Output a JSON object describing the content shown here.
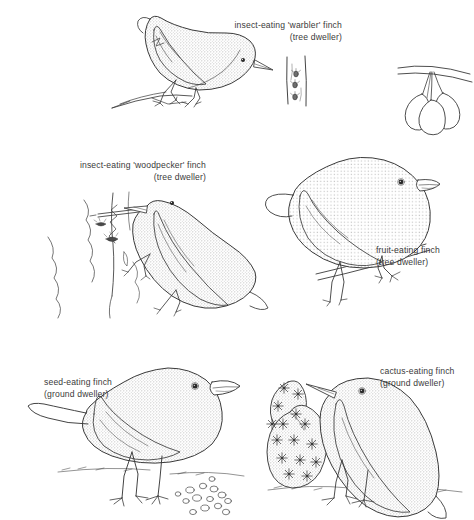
{
  "figure": {
    "background_color": "#ffffff",
    "line_color": "#3a3a3a",
    "fill_texture_color": "#b9b9b9"
  },
  "labels": {
    "warbler": {
      "line1": "insect-eating 'warbler' finch",
      "line2": "(tree dweller)"
    },
    "woodpecker": {
      "line1": "insect-eating 'woodpecker' finch",
      "line2": "(tree dweller)"
    },
    "fruit": {
      "line1": "fruit-eating finch",
      "line2": "(tree dweller)"
    },
    "seed": {
      "line1": "seed-eating finch",
      "line2": "(ground dweller)"
    },
    "cactus": {
      "line1": "cactus-eating finch",
      "line2": "(ground dweller)"
    }
  },
  "illustrations": [
    {
      "name": "warbler-finch",
      "description": "slender finch with thin pointed beak perched leaning forward on a thin twig",
      "beak": "thin, slender, pointed",
      "habitat_prop": "tree trunk with small insects"
    },
    {
      "name": "tree-trunk-with-insects",
      "description": "narrow vertical tree trunk with three small insects on bark",
      "insect_count": 3
    },
    {
      "name": "fruit-cluster",
      "description": "three hanging fruits on stalks from a diagonal branch",
      "fruit_count": 3
    },
    {
      "name": "woodpecker-finch",
      "description": "finch clinging to vertical branch holding a cactus spine twig in its beak to probe for grubs",
      "beak": "straight, stout, chisel-like",
      "habitat_prop": "branch with bark cracks and grubs",
      "grub_count": 3
    },
    {
      "name": "fruit-eating-finch",
      "description": "stout finch with thick conical beak perched on a diagonal branch below hanging fruit",
      "beak": "thick, deep, conical"
    },
    {
      "name": "seed-eating-finch",
      "description": "ground finch with very heavy crushing beak standing on ground among scattered seeds",
      "beak": "very heavy, blunt, crushing",
      "habitat_prop": "scattered seeds on ground"
    },
    {
      "name": "cactus-finch",
      "description": "ground finch with long pointed beak feeding at a prickly-pear cactus pad",
      "beak": "long, slender, decurved",
      "habitat_prop": "prickly pear cactus with spine clusters"
    }
  ]
}
